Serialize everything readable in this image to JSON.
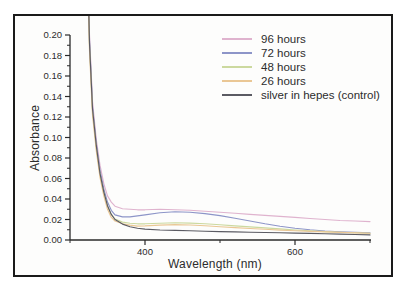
{
  "figure": {
    "background": "#fdfdfc",
    "border_color": "#1a1a1a",
    "axis_color": "#2a2a2a",
    "text_color": "#2c2c2c"
  },
  "chart_data": {
    "type": "line",
    "title": "",
    "xlabel": "Wavelength (nm)",
    "ylabel": "Absorbance",
    "xlim": [
      300,
      700
    ],
    "ylim": [
      0,
      0.2
    ],
    "grid": false,
    "legend_position": "upper right",
    "x_major_ticks": [
      {
        "value": 400,
        "label": "400"
      },
      {
        "value": 600,
        "label": "600"
      }
    ],
    "x_minor_ticks": [
      300,
      500,
      700
    ],
    "y_major_ticks": [
      {
        "value": 0.0,
        "label": "0.00"
      },
      {
        "value": 0.02,
        "label": "0.02"
      },
      {
        "value": 0.04,
        "label": "0.04"
      },
      {
        "value": 0.06,
        "label": "0.06"
      },
      {
        "value": 0.08,
        "label": "0.08"
      },
      {
        "value": 0.1,
        "label": "0.10"
      },
      {
        "value": 0.12,
        "label": "0.12"
      },
      {
        "value": 0.14,
        "label": "0.14"
      },
      {
        "value": 0.16,
        "label": "0.16"
      },
      {
        "value": 0.18,
        "label": "0.18"
      },
      {
        "value": 0.2,
        "label": "0.20"
      }
    ],
    "y_minor_ticks": [
      0.01,
      0.03,
      0.05,
      0.07,
      0.09,
      0.11,
      0.13,
      0.15,
      0.17,
      0.19
    ],
    "x": [
      318,
      322,
      326,
      330,
      335,
      340,
      345,
      350,
      355,
      360,
      370,
      380,
      390,
      400,
      420,
      440,
      460,
      480,
      500,
      520,
      540,
      560,
      580,
      600,
      620,
      640,
      660,
      680,
      700
    ],
    "series": [
      {
        "name": "96 hours",
        "color": "#dfb3ce",
        "values": [
          0.6,
          0.33,
          0.2,
          0.135,
          0.098,
          0.073,
          0.055,
          0.043,
          0.037,
          0.033,
          0.0305,
          0.03,
          0.0295,
          0.0295,
          0.03,
          0.0295,
          0.029,
          0.028,
          0.027,
          0.026,
          0.025,
          0.024,
          0.023,
          0.022,
          0.021,
          0.02,
          0.019,
          0.0185,
          0.018
        ]
      },
      {
        "name": "72 hours",
        "color": "#8d95c8",
        "values": [
          0.58,
          0.32,
          0.195,
          0.13,
          0.094,
          0.068,
          0.05,
          0.037,
          0.029,
          0.0245,
          0.0225,
          0.0225,
          0.0235,
          0.0245,
          0.0265,
          0.0275,
          0.027,
          0.0258,
          0.0238,
          0.0212,
          0.0185,
          0.0158,
          0.0135,
          0.0115,
          0.01,
          0.0088,
          0.008,
          0.0074,
          0.007
        ]
      },
      {
        "name": "48 hours",
        "color": "#ccd99f",
        "values": [
          0.57,
          0.31,
          0.19,
          0.126,
          0.09,
          0.064,
          0.046,
          0.033,
          0.025,
          0.0205,
          0.0175,
          0.0163,
          0.0158,
          0.0158,
          0.0163,
          0.0168,
          0.0165,
          0.0158,
          0.0148,
          0.0138,
          0.0128,
          0.0118,
          0.0108,
          0.0098,
          0.009,
          0.0082,
          0.0076,
          0.007,
          0.0065
        ]
      },
      {
        "name": "26 hours",
        "color": "#eac795",
        "values": [
          0.56,
          0.305,
          0.185,
          0.122,
          0.087,
          0.061,
          0.043,
          0.03,
          0.022,
          0.0185,
          0.0158,
          0.0145,
          0.0136,
          0.0138,
          0.0145,
          0.015,
          0.0146,
          0.0139,
          0.013,
          0.0121,
          0.0112,
          0.0104,
          0.0097,
          0.009,
          0.0084,
          0.0079,
          0.0074,
          0.0069,
          0.0065
        ]
      },
      {
        "name": "silver in hepes (control)",
        "color": "#5b5b63",
        "values": [
          0.58,
          0.315,
          0.192,
          0.128,
          0.092,
          0.065,
          0.047,
          0.0335,
          0.025,
          0.02,
          0.0155,
          0.013,
          0.0115,
          0.0106,
          0.0098,
          0.0094,
          0.009,
          0.0086,
          0.0082,
          0.0079,
          0.0076,
          0.0073,
          0.007,
          0.0067,
          0.0064,
          0.0061,
          0.0058,
          0.0054,
          0.005
        ]
      }
    ]
  }
}
